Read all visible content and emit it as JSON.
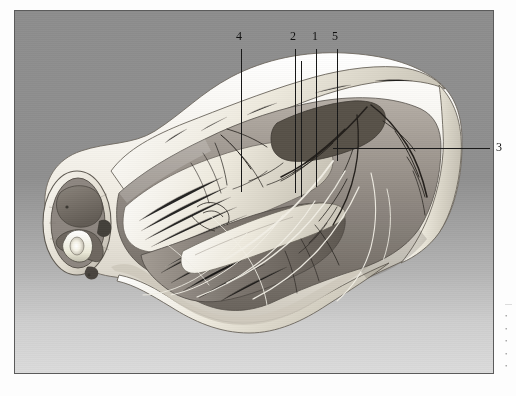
{
  "plate": {
    "title": "Anatomical dissection plate",
    "description": "Grayscale anatomical illustration of a dissected limb segment with skin flap reflected, showing muscles, vessels and nerves, and a transverse cut section at the left end.",
    "background_top_color": "#8e8e8e",
    "background_bottom_color": "#dcdcdc",
    "border_color": "#5b5b5b"
  },
  "labels": [
    {
      "id": "label-4",
      "text": "4",
      "x": 234,
      "y": 32,
      "leader": {
        "type": "vertical",
        "x": 240,
        "y_top": 48,
        "y_bottom": 191
      }
    },
    {
      "id": "label-2",
      "text": "2",
      "x": 288,
      "y": 32,
      "leader": {
        "type": "vertical",
        "x": 294,
        "y_top": 48,
        "y_bottom": 192
      }
    },
    {
      "id": "label-2b",
      "text": "",
      "x": 0,
      "y": 0,
      "leader": {
        "type": "vertical",
        "x": 300,
        "y_top": 60,
        "y_bottom": 196
      }
    },
    {
      "id": "label-1",
      "text": "1",
      "x": 311,
      "y": 32,
      "leader": {
        "type": "vertical",
        "x": 315,
        "y_top": 48,
        "y_bottom": 186
      }
    },
    {
      "id": "label-5",
      "text": "5",
      "x": 332,
      "y": 32,
      "leader": {
        "type": "vertical",
        "x": 336,
        "y_top": 48,
        "y_bottom": 160
      }
    },
    {
      "id": "label-3",
      "text": "3",
      "x": 495,
      "y": 141,
      "leader": {
        "type": "horizontal",
        "y": 147,
        "x_left": 332,
        "x_right": 489
      }
    }
  ],
  "edge_caption_fragments": [
    "—",
    "•",
    "•",
    "•",
    "•",
    "•"
  ],
  "colors": {
    "line": "#171717",
    "label_text": "#101010",
    "skin_flap": "#f2efe8",
    "muscle_mid": "#9a938c",
    "muscle_dark": "#6d6760",
    "bone": "#fbfaf6",
    "vessel": "#2b2823",
    "nerve": "#f6f4ef"
  }
}
